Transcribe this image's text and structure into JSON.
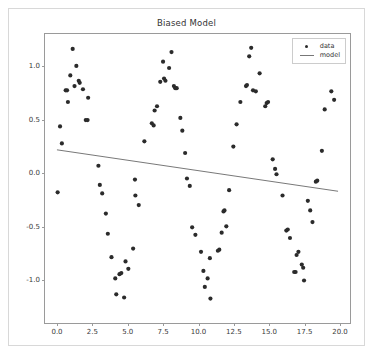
{
  "figure": {
    "title": "Biased Model",
    "background": "#ffffff",
    "border_color": "#d8d8d8"
  },
  "legend": {
    "position": "upper-right",
    "entries": [
      {
        "label": "data",
        "marker": "circle",
        "color": "#2b2b2b"
      },
      {
        "label": "model",
        "marker": "line",
        "color": "#777777"
      }
    ]
  },
  "chart_data": {
    "type": "scatter",
    "title": "Biased Model",
    "xlabel": "",
    "ylabel": "",
    "xlim": [
      -0.85,
      20.85
    ],
    "ylim": [
      -1.42,
      1.3
    ],
    "grid": false,
    "legend_position": "upper right",
    "xticks": [
      0.0,
      2.5,
      5.0,
      7.5,
      10.0,
      12.5,
      15.0,
      17.5,
      20.0
    ],
    "xtick_labels": [
      "0.0",
      "2.5",
      "5.0",
      "7.5",
      "10.0",
      "12.5",
      "15.0",
      "17.5",
      "20.0"
    ],
    "yticks": [
      1.0,
      0.5,
      0.0,
      -0.5,
      -1.0
    ],
    "ytick_labels": [
      "1.0",
      "0.5",
      "0.0",
      "-0.5",
      "-1.0"
    ],
    "series": [
      {
        "name": "data",
        "type": "scatter",
        "color": "#2b2b2b",
        "marker": "o",
        "marker_size": 4,
        "points": [
          [
            0.05,
            -0.19
          ],
          [
            0.22,
            0.43
          ],
          [
            0.35,
            0.27
          ],
          [
            0.62,
            0.77
          ],
          [
            0.72,
            0.77
          ],
          [
            0.78,
            0.66
          ],
          [
            0.95,
            0.91
          ],
          [
            1.12,
            1.16
          ],
          [
            1.25,
            0.81
          ],
          [
            1.38,
            1.0
          ],
          [
            1.55,
            0.86
          ],
          [
            1.62,
            0.84
          ],
          [
            1.85,
            0.78
          ],
          [
            2.05,
            0.49
          ],
          [
            2.18,
            0.49
          ],
          [
            2.22,
            0.7
          ],
          [
            2.95,
            0.06
          ],
          [
            3.05,
            -0.12
          ],
          [
            3.22,
            -0.2
          ],
          [
            3.48,
            -0.39
          ],
          [
            3.62,
            -0.58
          ],
          [
            3.88,
            -0.8
          ],
          [
            4.15,
            -1.0
          ],
          [
            4.22,
            -1.15
          ],
          [
            4.45,
            -0.96
          ],
          [
            4.58,
            -0.95
          ],
          [
            4.78,
            -1.18
          ],
          [
            4.88,
            -0.84
          ],
          [
            5.08,
            -0.91
          ],
          [
            5.42,
            -0.72
          ],
          [
            5.55,
            -0.07
          ],
          [
            5.58,
            -0.22
          ],
          [
            5.82,
            -0.31
          ],
          [
            6.22,
            0.29
          ],
          [
            6.75,
            0.46
          ],
          [
            6.88,
            0.44
          ],
          [
            6.95,
            0.58
          ],
          [
            7.12,
            0.62
          ],
          [
            7.35,
            0.85
          ],
          [
            7.55,
            1.04
          ],
          [
            7.62,
            0.88
          ],
          [
            7.72,
            0.86
          ],
          [
            7.98,
            0.98
          ],
          [
            8.15,
            1.13
          ],
          [
            8.32,
            0.81
          ],
          [
            8.42,
            0.79
          ],
          [
            8.52,
            0.79
          ],
          [
            8.78,
            0.51
          ],
          [
            8.92,
            0.39
          ],
          [
            9.12,
            0.18
          ],
          [
            9.25,
            -0.06
          ],
          [
            9.45,
            -0.13
          ],
          [
            9.62,
            -0.52
          ],
          [
            9.85,
            -0.59
          ],
          [
            10.25,
            -0.75
          ],
          [
            10.42,
            -0.93
          ],
          [
            10.52,
            -1.08
          ],
          [
            10.72,
            -1.0
          ],
          [
            10.88,
            -0.81
          ],
          [
            10.92,
            -1.19
          ],
          [
            11.45,
            -0.74
          ],
          [
            11.55,
            -0.73
          ],
          [
            11.72,
            -0.57
          ],
          [
            11.85,
            -0.37
          ],
          [
            11.92,
            -0.36
          ],
          [
            12.05,
            -0.51
          ],
          [
            12.25,
            -0.17
          ],
          [
            12.55,
            0.24
          ],
          [
            12.78,
            0.45
          ],
          [
            13.05,
            0.66
          ],
          [
            13.45,
            0.81
          ],
          [
            13.52,
            0.82
          ],
          [
            13.68,
            1.09
          ],
          [
            13.82,
            1.17
          ],
          [
            13.95,
            0.77
          ],
          [
            14.15,
            0.76
          ],
          [
            14.42,
            0.93
          ],
          [
            14.82,
            0.62
          ],
          [
            14.92,
            0.65
          ],
          [
            15.02,
            0.66
          ],
          [
            15.35,
            0.12
          ],
          [
            15.52,
            0.03
          ],
          [
            15.62,
            -0.02
          ],
          [
            16.05,
            -0.22
          ],
          [
            16.32,
            -0.55
          ],
          [
            16.42,
            -0.54
          ],
          [
            16.58,
            -0.62
          ],
          [
            16.88,
            -0.94
          ],
          [
            16.98,
            -0.94
          ],
          [
            17.05,
            -0.78
          ],
          [
            17.18,
            -0.75
          ],
          [
            17.42,
            -0.87
          ],
          [
            17.52,
            -0.9
          ],
          [
            17.58,
            -1.02
          ],
          [
            17.85,
            -0.27
          ],
          [
            18.02,
            -0.36
          ],
          [
            18.18,
            -0.47
          ],
          [
            18.42,
            -0.09
          ],
          [
            18.52,
            -0.08
          ],
          [
            18.85,
            0.2
          ],
          [
            19.05,
            0.59
          ],
          [
            19.52,
            0.76
          ],
          [
            19.72,
            0.68
          ]
        ]
      },
      {
        "name": "model",
        "type": "line",
        "color": "#777777",
        "linewidth": 1,
        "x": [
          0.0,
          20.0
        ],
        "y": [
          0.21,
          -0.18
        ]
      }
    ]
  }
}
